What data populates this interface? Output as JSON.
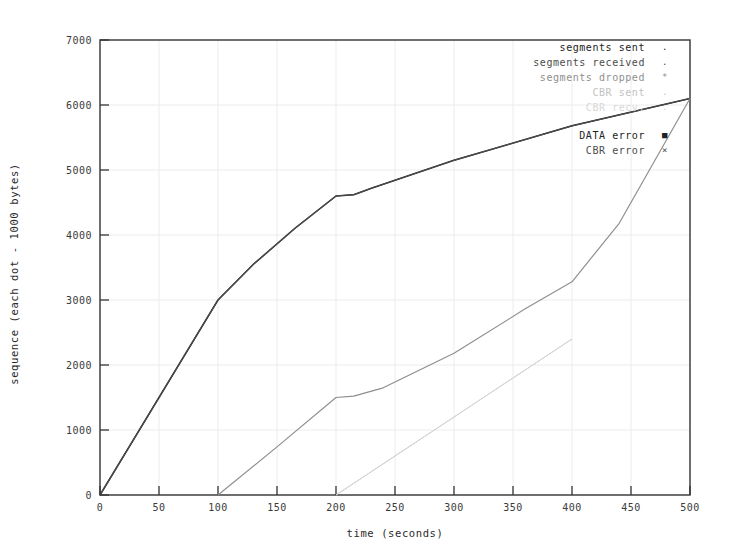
{
  "chart_data": {
    "type": "line",
    "title": "",
    "xlabel": "time (seconds)",
    "ylabel": "sequence (each dot - 1000 bytes)",
    "xlim": [
      0,
      500
    ],
    "ylim": [
      0,
      7000
    ],
    "xticks": [
      0,
      50,
      100,
      150,
      200,
      250,
      300,
      350,
      400,
      450,
      500
    ],
    "yticks": [
      0,
      1000,
      2000,
      3000,
      4000,
      5000,
      6000,
      7000
    ],
    "grid": true,
    "legend_position": "top-right",
    "series": [
      {
        "name": "segments sent",
        "marker": ".",
        "color": "#232323",
        "points": [
          [
            0,
            0
          ],
          [
            100,
            3000
          ],
          [
            130,
            3550
          ],
          [
            165,
            4100
          ],
          [
            200,
            4600
          ],
          [
            215,
            4620
          ],
          [
            230,
            4720
          ],
          [
            300,
            5150
          ],
          [
            400,
            5680
          ],
          [
            500,
            6100
          ]
        ]
      },
      {
        "name": "segments received",
        "marker": ".",
        "color": "#4c4c4c",
        "points": [
          [
            0,
            0
          ],
          [
            100,
            3000
          ],
          [
            130,
            3550
          ],
          [
            165,
            4100
          ],
          [
            200,
            4600
          ],
          [
            215,
            4620
          ],
          [
            230,
            4720
          ],
          [
            300,
            5150
          ],
          [
            400,
            5680
          ],
          [
            500,
            6100
          ]
        ]
      },
      {
        "name": "segments dropped",
        "marker": "*",
        "color": "#8f8f8f",
        "points": [
          [
            100,
            0
          ],
          [
            150,
            740
          ],
          [
            200,
            1500
          ],
          [
            215,
            1520
          ],
          [
            240,
            1650
          ],
          [
            300,
            2180
          ],
          [
            360,
            2860
          ],
          [
            400,
            3280
          ],
          [
            440,
            4180
          ],
          [
            500,
            6100
          ]
        ]
      },
      {
        "name": "CBR sent",
        "marker": ".",
        "color": "#c2c2c2",
        "points": [
          [
            200,
            0
          ],
          [
            300,
            1200
          ],
          [
            400,
            2400
          ]
        ]
      },
      {
        "name": "CBR recv.",
        "marker": ".",
        "color": "#d8d8d8",
        "points": [
          [
            200,
            0
          ],
          [
            300,
            1200
          ],
          [
            400,
            2400
          ]
        ]
      }
    ],
    "event_series": [
      {
        "name": "DATA error",
        "marker": "square",
        "color": "#111111",
        "points": []
      },
      {
        "name": "CBR error",
        "marker": "x",
        "color": "#555555",
        "points": []
      }
    ]
  },
  "legend": {
    "entries": [
      {
        "label": "segments sent",
        "marker": ".",
        "class": "lvl-dark"
      },
      {
        "label": "segments received",
        "marker": ".",
        "class": "lvl-mid"
      },
      {
        "label": "segments dropped",
        "marker": "*",
        "class": "lvl-light"
      },
      {
        "label": "CBR sent",
        "marker": ".",
        "class": "lvl-faint"
      },
      {
        "label": "CBR recv.",
        "marker": ".",
        "class": "lvl-vfaint"
      }
    ],
    "event_entries": [
      {
        "label": "DATA error",
        "marker": "■",
        "class": "lvl-dark"
      },
      {
        "label": "CBR error",
        "marker": "×",
        "class": "lvl-mid"
      }
    ]
  },
  "axes": {
    "x_title": "time (seconds)",
    "y_title": "sequence (each dot - 1000 bytes)",
    "x_tick_labels": [
      "0",
      "50",
      "100",
      "150",
      "200",
      "250",
      "300",
      "350",
      "400",
      "450",
      "500"
    ],
    "y_tick_labels": [
      "0",
      "1000",
      "2000",
      "3000",
      "4000",
      "5000",
      "6000",
      "7000"
    ]
  },
  "colors": {
    "frame": "#333333",
    "grid": "#e8e8e8",
    "series_dark": "#232323",
    "series_mid": "#4c4c4c",
    "series_light": "#8f8f8f",
    "series_faint": "#c2c2c2"
  }
}
